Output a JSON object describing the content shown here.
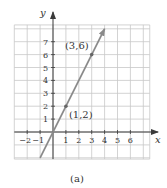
{
  "chart_data": {
    "type": "line",
    "title": "",
    "caption": "(a)",
    "xlabel": "x",
    "ylabel": "y",
    "xlim": [
      -3,
      7.5
    ],
    "ylim": [
      -2.1,
      8.3
    ],
    "grid": true,
    "x_ticks": [
      -2,
      -1,
      1,
      2,
      3,
      4,
      5,
      6
    ],
    "y_ticks": [
      1,
      2,
      3,
      4,
      5,
      6,
      7
    ],
    "series": [
      {
        "name": "y = 2x",
        "x": [
          -1,
          4
        ],
        "y": [
          -2,
          8
        ],
        "arrow_end": true,
        "color": "#8a8a8a"
      }
    ],
    "points": [
      {
        "x": 1,
        "y": 2,
        "label": "(1, 2)"
      },
      {
        "x": 3,
        "y": 6,
        "label": "(3, 6)"
      }
    ]
  }
}
